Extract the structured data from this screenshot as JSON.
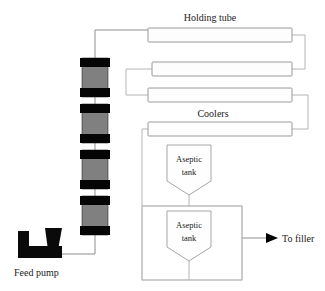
{
  "diagram": {
    "labels": {
      "holding_tube": "Holding tube",
      "coolers": "Coolers",
      "feed_pump": "Feed pump",
      "to_filler": "To filler",
      "aseptic_tank_upper_line1": "Aseptic",
      "aseptic_tank_upper_line2": "tank",
      "aseptic_tank_lower_line1": "Aseptic",
      "aseptic_tank_lower_line2": "tank"
    },
    "colors": {
      "pipe_fill": "#fdfdfd",
      "pipe_stroke": "#9a9a9a",
      "connector_stroke": "#b4b4b4",
      "heat_exchanger_cap": "#050505",
      "heat_exchanger_body": "#808080",
      "pump_fill": "#0a0a0a",
      "text": "#1a1a1a",
      "background": "#ffffff"
    },
    "components": {
      "heat_exchangers": [
        {
          "name": "heat-exchanger-1",
          "x": 82,
          "y": 58,
          "width": 26,
          "height": 39
        },
        {
          "name": "heat-exchanger-2",
          "x": 82,
          "y": 104,
          "width": 26,
          "height": 39
        },
        {
          "name": "heat-exchanger-3",
          "x": 82,
          "y": 150,
          "width": 26,
          "height": 39
        },
        {
          "name": "heat-exchanger-4",
          "x": 82,
          "y": 196,
          "width": 26,
          "height": 39
        }
      ],
      "pipes": [
        {
          "name": "pipe-holding-tube",
          "x": 148,
          "y": 28,
          "width": 144,
          "height": 14
        },
        {
          "name": "pipe-cooler-2",
          "x": 152,
          "y": 62,
          "width": 140,
          "height": 14
        },
        {
          "name": "pipe-cooler-3",
          "x": 148,
          "y": 88,
          "width": 144,
          "height": 14
        },
        {
          "name": "pipe-cooler-4",
          "x": 148,
          "y": 122,
          "width": 144,
          "height": 14
        }
      ],
      "tanks": [
        {
          "name": "aseptic-tank-upper",
          "x": 167,
          "y": 145,
          "width": 44,
          "height": 50
        },
        {
          "name": "aseptic-tank-lower",
          "x": 167,
          "y": 211,
          "width": 44,
          "height": 50
        }
      ],
      "enclosures": [
        {
          "name": "tank-enclosure-lower",
          "x": 142,
          "y": 206,
          "width": 100,
          "height": 74
        }
      ]
    }
  }
}
